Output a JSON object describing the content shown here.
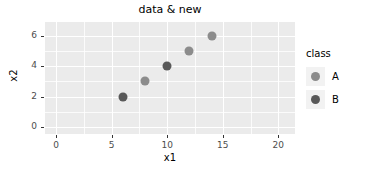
{
  "chart_data": {
    "type": "scatter",
    "title": "data & new",
    "xlabel": "x1",
    "ylabel": "x2",
    "xlim": [
      -1.0,
      21.5
    ],
    "ylim": [
      -0.45,
      6.9
    ],
    "xticks": [
      0,
      5,
      10,
      15,
      20
    ],
    "xticklabels": [
      "0",
      "5",
      "10",
      "15",
      "20"
    ],
    "yticks": [
      0,
      2,
      4,
      6
    ],
    "yticklabels": [
      "0",
      "2",
      "4",
      "6"
    ],
    "x_minor_ticks": [
      2.5,
      7.5,
      12.5,
      17.5
    ],
    "y_minor_ticks": [
      1,
      3,
      5
    ],
    "grid": true,
    "panel_background": "#ebebeb",
    "gridline_color": "#ffffff",
    "legend": {
      "title": "class",
      "position": "right",
      "entries": [
        {
          "label": "A",
          "color": "#8c8c8c"
        },
        {
          "label": "B",
          "color": "#595959"
        }
      ]
    },
    "series": [
      {
        "name": "A",
        "color": "#8c8c8c",
        "points": [
          {
            "x": 8,
            "y": 3
          },
          {
            "x": 12,
            "y": 5
          },
          {
            "x": 14,
            "y": 6
          }
        ]
      },
      {
        "name": "B",
        "color": "#595959",
        "points": [
          {
            "x": 6,
            "y": 2
          },
          {
            "x": 10,
            "y": 4
          }
        ]
      }
    ]
  }
}
